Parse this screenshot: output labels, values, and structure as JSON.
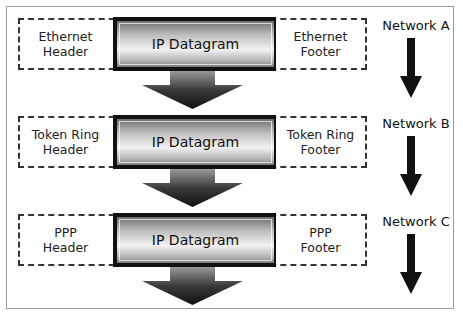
{
  "diagram": {
    "colors": {
      "frame_border": "#9a9a9a",
      "dashed_border": "#333333",
      "datagram_border": "#111111",
      "arrow": "#1a1a1a"
    },
    "rows": [
      {
        "network_label": "Network A",
        "header_label": "Ethernet Header",
        "header_lines": [
          "Ethernet",
          "Header"
        ],
        "payload_label": "IP Datagram",
        "footer_label": "Ethernet Footer",
        "footer_lines": [
          "Ethernet",
          "Footer"
        ]
      },
      {
        "network_label": "Network B",
        "header_label": "Token Ring Header",
        "header_lines": [
          "Token Ring",
          "Header"
        ],
        "payload_label": "IP Datagram",
        "footer_label": "Token Ring Footer",
        "footer_lines": [
          "Token Ring",
          "Footer"
        ]
      },
      {
        "network_label": "Network C",
        "header_label": "PPP Header",
        "header_lines": [
          "PPP",
          "Header"
        ],
        "payload_label": "IP Datagram",
        "footer_label": "PPP Footer",
        "footer_lines": [
          "PPP",
          "Footer"
        ]
      }
    ]
  }
}
